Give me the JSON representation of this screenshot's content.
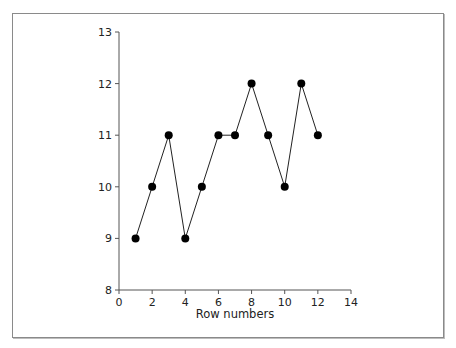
{
  "chart_data": {
    "type": "line",
    "title": "",
    "xlabel": "Row numbers",
    "ylabel": "",
    "x": [
      1,
      2,
      3,
      4,
      5,
      6,
      7,
      8,
      9,
      10,
      11,
      12
    ],
    "series": [
      {
        "name": "values",
        "values": [
          9,
          10,
          11,
          9,
          10,
          11,
          11,
          12,
          11,
          10,
          12,
          11
        ],
        "color": "#000000",
        "marker": "filled-circle"
      }
    ],
    "xlim": [
      0,
      14
    ],
    "ylim": [
      8,
      13
    ],
    "xticks": [
      0,
      2,
      4,
      6,
      8,
      10,
      12,
      14
    ],
    "yticks": [
      8,
      9,
      10,
      11,
      12,
      13
    ],
    "grid": false,
    "legend": "none"
  },
  "axes": {
    "x_title": "Row numbers",
    "x_tick_labels": [
      "0",
      "2",
      "4",
      "6",
      "8",
      "10",
      "12",
      "14"
    ],
    "y_tick_labels": [
      "8",
      "9",
      "10",
      "11",
      "12",
      "13"
    ]
  }
}
